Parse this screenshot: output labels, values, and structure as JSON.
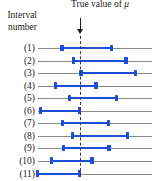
{
  "figure": {
    "title": "True value of ",
    "title_symbol": "μ",
    "axis_caption_line1": "Interval",
    "axis_caption_line2": "number",
    "arrow_icon": "down-arrow-icon",
    "reference_line_icon": "vertical-dashed-line-icon",
    "colors": {
      "interval": "#1b4fd8",
      "axis": "#8a8a8a",
      "reference": "#3a3a3a",
      "text": "#1a1a1a",
      "background": "#ffffff"
    }
  },
  "chart_data": {
    "type": "interval",
    "title": "True value of μ",
    "xlabel": "",
    "ylabel": "Interval number",
    "true_value": 0,
    "xlim": [
      -2.2,
      2.2
    ],
    "grid": false,
    "legend": "none",
    "categories": [
      "(1)",
      "(2)",
      "(3)",
      "(4)",
      "(5)",
      "(6)",
      "(7)",
      "(8)",
      "(9)",
      "(10)",
      "(11)"
    ],
    "intervals": [
      {
        "label": "(1)",
        "lower": -0.72,
        "upper": 1.32,
        "contains_true_value": true
      },
      {
        "label": "(2)",
        "lower": -0.25,
        "upper": 1.92,
        "contains_true_value": true
      },
      {
        "label": "(3)",
        "lower": 0.06,
        "upper": 2.3,
        "contains_true_value": false
      },
      {
        "label": "(4)",
        "lower": -0.98,
        "upper": 0.68,
        "contains_true_value": true
      },
      {
        "label": "(5)",
        "lower": -0.4,
        "upper": 1.53,
        "contains_true_value": true
      },
      {
        "label": "(6)",
        "lower": -1.6,
        "upper": 0.0,
        "contains_true_value": false
      },
      {
        "label": "(7)",
        "lower": -0.7,
        "upper": 1.2,
        "contains_true_value": true
      },
      {
        "label": "(8)",
        "lower": -0.28,
        "upper": 1.98,
        "contains_true_value": true
      },
      {
        "label": "(9)",
        "lower": -0.65,
        "upper": 1.22,
        "contains_true_value": true
      },
      {
        "label": "(10)",
        "lower": -1.14,
        "upper": 0.52,
        "contains_true_value": true
      },
      {
        "label": "(11)",
        "lower": -1.72,
        "upper": 0.0,
        "contains_true_value": false
      }
    ]
  }
}
